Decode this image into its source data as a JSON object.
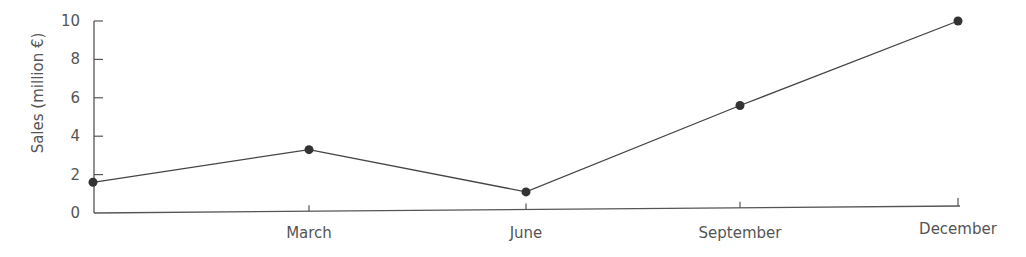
{
  "chart_data": {
    "type": "line",
    "title": "",
    "xlabel": "",
    "ylabel": "Sales (million €)",
    "ylim": [
      0,
      10
    ],
    "yticks": [
      0,
      2,
      4,
      6,
      8,
      10
    ],
    "grid": false,
    "legend": null,
    "categories": [
      "",
      "March",
      "June",
      "September",
      "December"
    ],
    "series": [
      {
        "name": "Sales",
        "values": [
          1.6,
          3.3,
          1.1,
          5.6,
          10.0
        ]
      }
    ]
  },
  "colors": {
    "line": "#444444",
    "marker": "#333333",
    "axis": "#555555",
    "text": "#555555"
  }
}
